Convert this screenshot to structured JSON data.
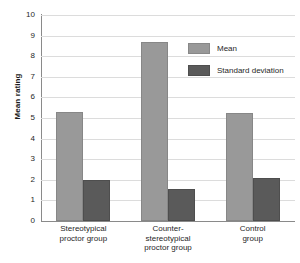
{
  "chart_data": {
    "type": "bar",
    "title": "",
    "xlabel": "",
    "ylabel": "Mean rating",
    "ylim": [
      0,
      10
    ],
    "ytick_step": 1,
    "grid": true,
    "legend_position": "top-right",
    "categories": [
      "Stereotypical proctor group",
      "Counter-stereotypical proctor group",
      "Control group"
    ],
    "category_lines": [
      [
        "Stereotypical",
        "proctor group"
      ],
      [
        "Counter-",
        "stereotypical",
        "proctor group"
      ],
      [
        "Control",
        "group"
      ]
    ],
    "ytick_labels": [
      "10",
      "9",
      "8",
      "7",
      "6",
      "5",
      "4",
      "3",
      "2",
      "1",
      "0"
    ],
    "series": [
      {
        "name": "Mean",
        "color": "#999999",
        "values": [
          5.3,
          8.7,
          5.25
        ]
      },
      {
        "name": "Standard deviation",
        "color": "#5a5a5a",
        "values": [
          2.0,
          1.55,
          2.1
        ]
      }
    ]
  },
  "legend": {
    "items": [
      {
        "label": "Mean",
        "color": "#999999"
      },
      {
        "label": "Standard deviation",
        "color": "#5a5a5a"
      }
    ]
  },
  "axes": {
    "y_title": "Mean rating"
  },
  "colors": {
    "mean": "#999999",
    "standard_deviation": "#5a5a5a",
    "gridline": "#dcdcdc",
    "axis": "#8a8a8a",
    "background": "#ffffff"
  }
}
